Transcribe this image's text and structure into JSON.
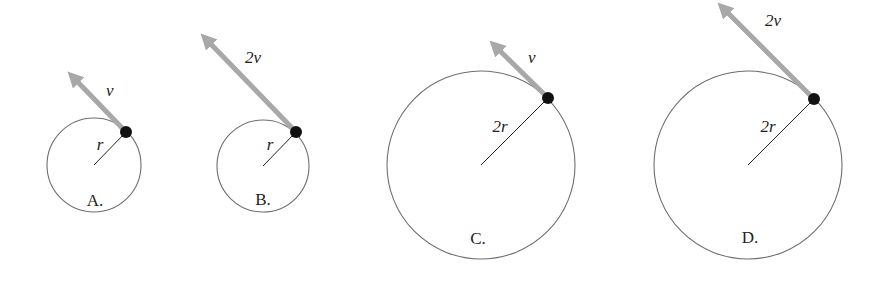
{
  "figure": {
    "colors": {
      "circle": "#6e6e6e",
      "radius_line": "#222222",
      "arrow": "#a8a8a8",
      "dot": "#111111",
      "text": "#222222"
    },
    "panels": [
      {
        "option": "A.",
        "speed_label": "v",
        "radius_label": "r",
        "cx": 94,
        "cy": 165,
        "R": 47,
        "dot": [
          126,
          132
        ],
        "arrow_tip": [
          68,
          72
        ],
        "speed_pos": [
          106,
          96
        ],
        "radius_pos": [
          100,
          150
        ],
        "option_pos": [
          95,
          206
        ]
      },
      {
        "option": "B.",
        "speed_label": "2v",
        "radius_label": "r",
        "cx": 263,
        "cy": 166,
        "R": 46,
        "dot": [
          296,
          132
        ],
        "arrow_tip": [
          201,
          34
        ],
        "speed_pos": [
          245,
          63
        ],
        "radius_pos": [
          270,
          150
        ],
        "option_pos": [
          263,
          205
        ]
      },
      {
        "option": "C.",
        "speed_label": "v",
        "radius_label": "2r",
        "cx": 481,
        "cy": 165,
        "R": 94,
        "dot": [
          548,
          98
        ],
        "arrow_tip": [
          490,
          41
        ],
        "speed_pos": [
          528,
          63
        ],
        "radius_pos": [
          500,
          132
        ],
        "option_pos": [
          478,
          244
        ]
      },
      {
        "option": "D.",
        "speed_label": "2v",
        "radius_label": "2r",
        "cx": 748,
        "cy": 165,
        "R": 94,
        "dot": [
          814,
          99
        ],
        "arrow_tip": [
          718,
          3
        ],
        "speed_pos": [
          765,
          26
        ],
        "radius_pos": [
          768,
          132
        ],
        "option_pos": [
          750,
          243
        ]
      }
    ]
  }
}
